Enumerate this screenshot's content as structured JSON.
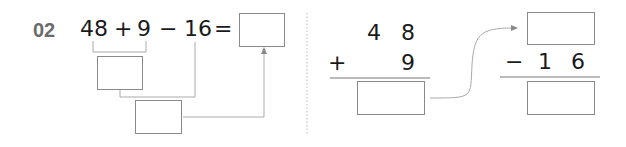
{
  "problem": {
    "number": "02",
    "expression": {
      "a": "48",
      "op1": "+",
      "b": "9",
      "op2": "−",
      "c": "16",
      "eq": "="
    },
    "vertical_add": {
      "top_tens": "4",
      "top_ones": "8",
      "operator": "+",
      "bottom_ones": "9"
    },
    "vertical_sub": {
      "operator": "−",
      "bottom_tens": "1",
      "bottom_ones": "6"
    }
  },
  "colors": {
    "text": "#1a1a1a",
    "number_label": "#6b6b6b",
    "lines": "#9a9a9a"
  }
}
